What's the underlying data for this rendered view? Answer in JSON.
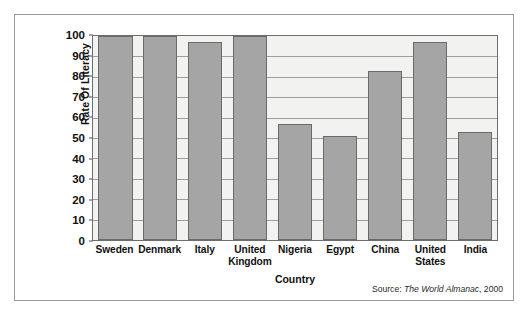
{
  "chart_data": {
    "type": "bar",
    "title": "",
    "xlabel": "Country",
    "ylabel": "Rate Of Literacy",
    "categories": [
      "Sweden",
      "Denmark",
      "Italy",
      "United Kingdom",
      "Nigeria",
      "Egypt",
      "China",
      "United States",
      "India"
    ],
    "values": [
      100,
      100,
      97,
      100,
      57,
      51,
      83,
      97,
      53
    ],
    "ylim": [
      0,
      100
    ],
    "ytick_values": [
      100,
      90,
      80,
      70,
      60,
      50,
      40,
      30,
      20,
      10,
      0
    ],
    "ytick_labels": [
      "100",
      "90",
      "80",
      "70",
      "60",
      "50",
      "40",
      "30",
      "20",
      "10",
      "0"
    ],
    "grid": true,
    "legend": false,
    "bar_color": "#a5a5a5",
    "bar_border_color": "#6a6a6a",
    "plot_background": "#f2f2f0",
    "gridline_color": "#9d9d9d"
  },
  "source": {
    "prefix": "Source:",
    "publication": "The World Almanac",
    "year": ", 2000"
  },
  "category_lines": [
    [
      "Sweden"
    ],
    [
      "Denmark"
    ],
    [
      "Italy"
    ],
    [
      "United",
      "Kingdom"
    ],
    [
      "Nigeria"
    ],
    [
      "Egypt"
    ],
    [
      "China"
    ],
    [
      "United",
      "States"
    ],
    [
      "India"
    ]
  ]
}
